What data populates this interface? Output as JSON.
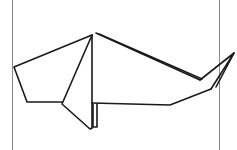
{
  "diagram": {
    "subject": "origami whale",
    "stroke_color": "#1a1a1a",
    "frame_color": "#8a8a8a",
    "background": "#ffffff",
    "frame": {
      "left_x": 12,
      "right_x": 219
    },
    "shapes": {
      "head_outline": "92,35 14,67 27,102 62,102",
      "fin_flap": "92,35 62,104 90,129 92,128",
      "center_fold": "92,35 92,128",
      "leg_fold": "93,104 93,127 97,127 97,104",
      "body_bottom": "92,103 170,105 211,89",
      "back_outer": "96,33 200,80",
      "back_inner": "99,34 202,79",
      "tail_top": "200,80 234,53 211,89",
      "tail_fold": "234,53 216,87"
    }
  }
}
